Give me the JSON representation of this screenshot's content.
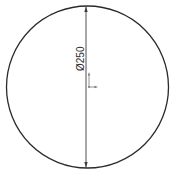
{
  "drawing": {
    "shape": "circle",
    "dimension": {
      "type": "diameter",
      "label": "Ø250",
      "value": 250
    },
    "colors": {
      "outline": "#2b2b2b",
      "dimension_line": "#3a3a3a",
      "origin_triad": "#7a7a7a",
      "background": "#ffffff"
    },
    "origin_icon": "origin-triad-icon"
  }
}
